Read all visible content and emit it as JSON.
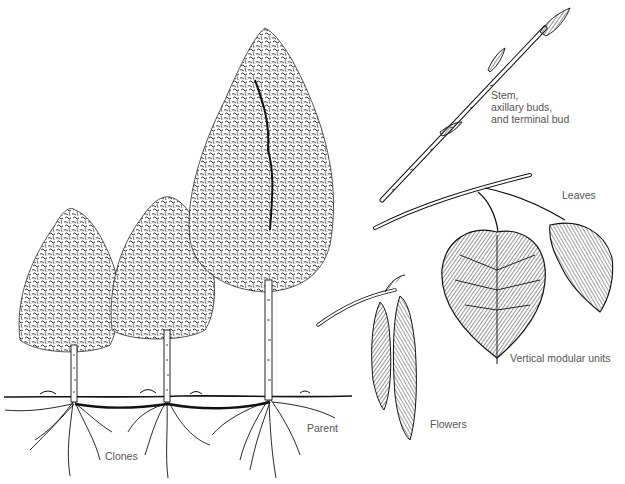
{
  "figure": {
    "ink_color": "#111111",
    "label_color": "#555555",
    "background": "#ffffff"
  },
  "labels": {
    "stem": {
      "lines": [
        "Stem,",
        "axillary buds,",
        "and terminal bud"
      ]
    },
    "leaves": "Leaves",
    "vertical_modular_units": "Vertical modular units",
    "flowers": "Flowers",
    "parent": "Parent",
    "clones": "Clones"
  },
  "trees": [
    {
      "role": "clone",
      "label": "Clone 1"
    },
    {
      "role": "clone",
      "label": "Clone 2"
    },
    {
      "role": "parent",
      "label": "Parent"
    }
  ]
}
